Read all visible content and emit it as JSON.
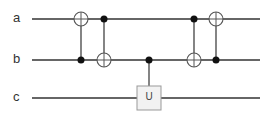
{
  "circuit": {
    "wires": [
      {
        "label": "a",
        "y": 19
      },
      {
        "label": "b",
        "y": 60
      },
      {
        "label": "c",
        "y": 98
      }
    ],
    "gates": [
      {
        "type": "cnot",
        "x": 81,
        "control": "b",
        "target": "a"
      },
      {
        "type": "cnot",
        "x": 104,
        "control": "a",
        "target": "b"
      },
      {
        "type": "controlled-u",
        "x": 149,
        "control": "b",
        "target": "c",
        "label": "U"
      },
      {
        "type": "cnot",
        "x": 194,
        "control": "a",
        "target": "b"
      },
      {
        "type": "cnot",
        "x": 216,
        "control": "b",
        "target": "a"
      }
    ],
    "colors": {
      "line": "#333333",
      "box_fill": "#f2f2f2",
      "box_stroke": "#999999"
    }
  }
}
